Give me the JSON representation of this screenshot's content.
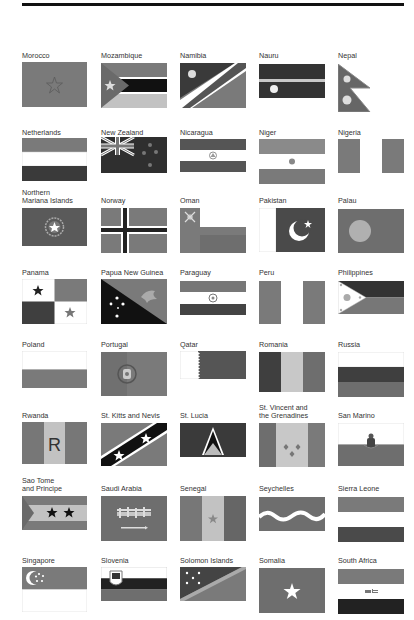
{
  "page": {
    "rule": "top-rule",
    "grayscale": true
  },
  "palette": {
    "dark": "#3a3a3a",
    "mid": "#6e6e6e",
    "midlight": "#8a8a8a",
    "light": "#b9b9b9",
    "white": "#ffffff",
    "black": "#111111"
  },
  "flags": [
    {
      "name": "Morocco"
    },
    {
      "name": "Mozambique"
    },
    {
      "name": "Namibia"
    },
    {
      "name": "Nauru"
    },
    {
      "name": "Nepal"
    },
    {
      "name": "Netherlands"
    },
    {
      "name": "New Zealand"
    },
    {
      "name": "Nicaragua"
    },
    {
      "name": "Niger"
    },
    {
      "name": "Nigeria"
    },
    {
      "name": "Northern\nMariana Islands"
    },
    {
      "name": "Norway"
    },
    {
      "name": "Oman"
    },
    {
      "name": "Pakistan"
    },
    {
      "name": "Palau"
    },
    {
      "name": "Panama"
    },
    {
      "name": "Papua New Guinea"
    },
    {
      "name": "Paraguay"
    },
    {
      "name": "Peru"
    },
    {
      "name": "Philippines"
    },
    {
      "name": "Poland"
    },
    {
      "name": "Portugal"
    },
    {
      "name": "Qatar"
    },
    {
      "name": "Romania"
    },
    {
      "name": "Russia"
    },
    {
      "name": "Rwanda",
      "emblem_text": "R"
    },
    {
      "name": "St. Kitts and Nevis"
    },
    {
      "name": "St. Lucia"
    },
    {
      "name": "St. Vincent and\nthe Grenadines"
    },
    {
      "name": "San Marino"
    },
    {
      "name": "Sao Tome\nand Principe"
    },
    {
      "name": "Saudi Arabia"
    },
    {
      "name": "Senegal"
    },
    {
      "name": "Seychelles"
    },
    {
      "name": "Sierra Leone"
    },
    {
      "name": "Singapore"
    },
    {
      "name": "Slovenia"
    },
    {
      "name": "Solomon Islands"
    },
    {
      "name": "Somalia"
    },
    {
      "name": "South Africa"
    }
  ]
}
